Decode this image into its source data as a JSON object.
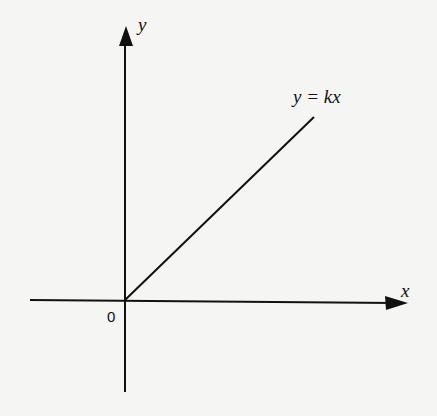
{
  "diagram": {
    "type": "coordinate-plane",
    "axes": {
      "x_label": "x",
      "y_label": "y",
      "origin_label": "0"
    },
    "line": {
      "equation_label": "y = kx",
      "description": "straight line through origin with positive slope, drawn in first quadrant"
    },
    "colors": {
      "background": "#f5f5f3",
      "ink": "#111111"
    }
  }
}
